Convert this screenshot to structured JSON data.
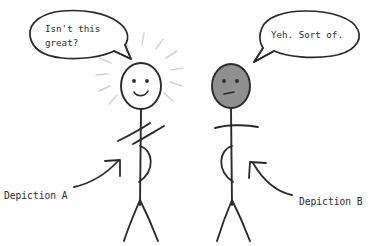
{
  "canvas": {
    "width": 383,
    "height": 246,
    "background": "#ffffff",
    "ink_color": "#2b2b2b",
    "ray_color": "#d2d2d2",
    "gray_fill": "#8f8f8f"
  },
  "speech_bubbles": [
    {
      "id": "left",
      "speaker": "depiction-a-figure",
      "lines": [
        "Isn't this",
        "great?"
      ]
    },
    {
      "id": "right",
      "speaker": "depiction-b-figure",
      "lines": [
        "Yeh. Sort of."
      ]
    }
  ],
  "figures": [
    {
      "id": "a",
      "mood": "happy",
      "head_fill": "#ffffff",
      "has_rays": true,
      "expression": "smile"
    },
    {
      "id": "b",
      "mood": "neutral",
      "head_fill": "#8f8f8f",
      "has_rays": false,
      "expression": "flat"
    }
  ],
  "annotations": [
    {
      "id": "a",
      "label": "Depiction A",
      "target": "left-figure-torso"
    },
    {
      "id": "b",
      "label": "Depiction B",
      "target": "right-figure-torso"
    }
  ]
}
